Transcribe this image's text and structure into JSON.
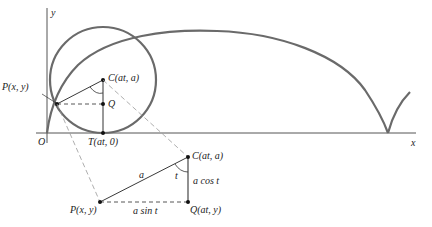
{
  "colors": {
    "curve": "#6a6a6a",
    "line": "#222222",
    "dashed": "#888888",
    "axis": "#555555"
  },
  "axes": {
    "x_label": "x",
    "y_label": "y",
    "origin_label": "O"
  },
  "main_figure": {
    "point_P": "P(x, y)",
    "point_C": "C(at, a)",
    "point_Q": "Q",
    "point_T": "T(at, 0)"
  },
  "detail_figure": {
    "point_C": "C(at, a)",
    "point_P": "P(x, y)",
    "point_Q": "Q(at, y)",
    "hypotenuse_label": "a",
    "angle_label": "t",
    "vertical_label": "a cos t",
    "horizontal_label": "a sin t"
  }
}
